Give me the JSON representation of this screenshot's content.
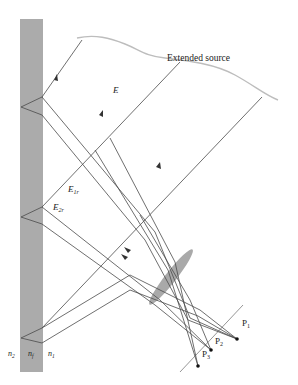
{
  "labels": {
    "source": "Extended source",
    "E": "E",
    "E1r_main": "E",
    "E1r_sub": "1r",
    "E2r_main": "E",
    "E2r_sub": "2r",
    "n2_main": "n",
    "n2_sub": "2",
    "nf_main": "n",
    "nf_sub": "f",
    "n1_main": "n",
    "n1_sub": "1",
    "P1_main": "P",
    "P1_sub": "1",
    "P2_main": "P",
    "P2_sub": "2",
    "P3_main": "P",
    "P3_sub": "3"
  },
  "colors": {
    "film": "#ababab",
    "lens": "#a9a9a9",
    "source_curve": "#bdbdbd",
    "ray": "#4a4a4a",
    "text": "#222222"
  }
}
